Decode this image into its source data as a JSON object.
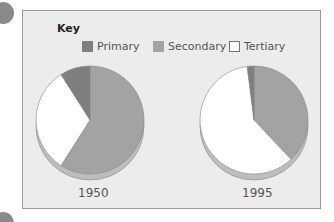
{
  "chart_data": [
    {
      "type": "pie",
      "title": "1950",
      "categories": [
        "Primary",
        "Secondary",
        "Tertiary"
      ],
      "values": [
        9,
        59,
        32
      ]
    },
    {
      "type": "pie",
      "title": "1995",
      "categories": [
        "Primary",
        "Secondary",
        "Tertiary"
      ],
      "values": [
        2,
        38,
        60
      ]
    }
  ],
  "legend": {
    "title": "Key",
    "items": [
      {
        "label": "Primary",
        "color": "#7f7f7f"
      },
      {
        "label": "Secondary",
        "color": "#a3a3a3"
      },
      {
        "label": "Tertiary",
        "color": "#ffffff"
      }
    ]
  },
  "labels": {
    "left": "1950",
    "right": "1995"
  }
}
